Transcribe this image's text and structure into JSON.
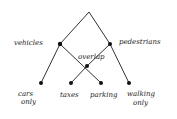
{
  "diagram": {
    "type": "hand-drawn lattice",
    "nodes": [
      {
        "id": "root",
        "label": ""
      },
      {
        "id": "vehicles",
        "label": "vehicles"
      },
      {
        "id": "pedestrians",
        "label": "pedestrians"
      },
      {
        "id": "overlap",
        "label": "overlap"
      },
      {
        "id": "cars_only",
        "label_line1": "cars",
        "label_line2": "only"
      },
      {
        "id": "taxes",
        "label": "taxes"
      },
      {
        "id": "parking",
        "label": "parking"
      },
      {
        "id": "walking_only",
        "label_line1": "walking",
        "label_line2": "only"
      }
    ],
    "edges": [
      [
        "root",
        "vehicles"
      ],
      [
        "root",
        "pedestrians"
      ],
      [
        "vehicles",
        "cars_only"
      ],
      [
        "vehicles",
        "overlap"
      ],
      [
        "pedestrians",
        "overlap"
      ],
      [
        "pedestrians",
        "walking_only"
      ],
      [
        "overlap",
        "taxes"
      ],
      [
        "overlap",
        "parking"
      ]
    ]
  }
}
